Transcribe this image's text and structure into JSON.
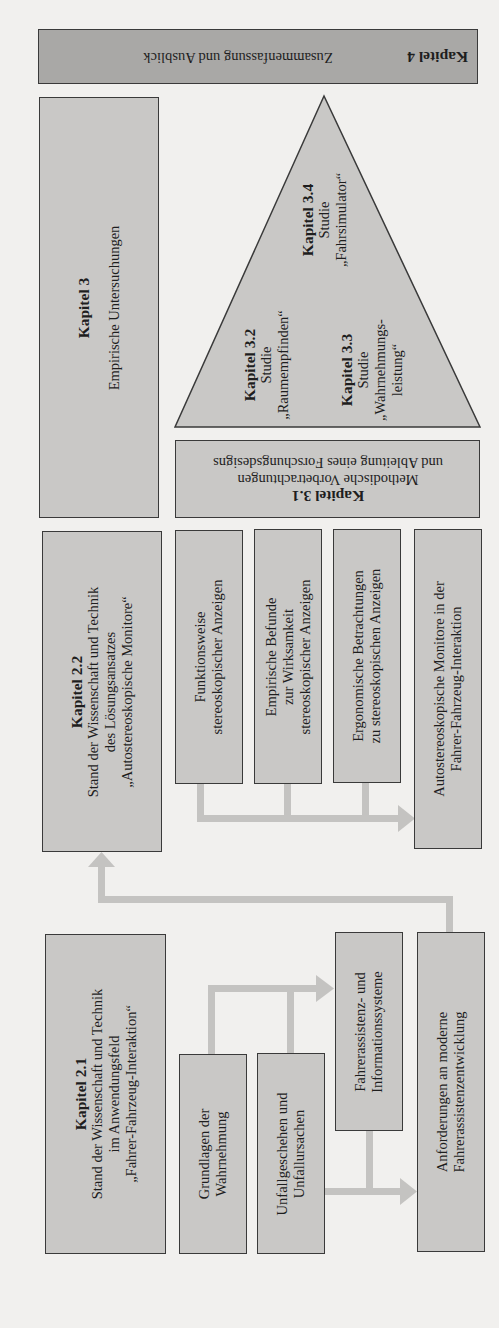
{
  "diagram": {
    "orientation": "rotated 90° counter-clockwise (landscape figure on portrait page)",
    "colors": {
      "page_background": "#f1f0ee",
      "box_fill": "#c9c8c6",
      "box_fill_dark": "#a9a8a6",
      "box_border": "#3a3a3a",
      "arrow": "#c4c3c1"
    },
    "kapitel4": {
      "title": "Kapitel 4",
      "text": "Zusammenfassung und Ausblick"
    },
    "kapitel3": {
      "title": "Kapitel 3",
      "text": "Empirische Untersuchungen"
    },
    "kapitel3_1": {
      "title": "Kapitel 3.1",
      "line1": "Methodische Vorbetrachtungen",
      "line2": "und Ableitung eines Forschungsdesigns"
    },
    "pyramid": {
      "kapitel3_2": {
        "title": "Kapitel 3.2",
        "line1": "Studie",
        "line2": "„Raumempfinden“"
      },
      "kapitel3_3": {
        "title": "Kapitel 3.3",
        "line1": "Studie",
        "line2": "„Wahrnehmungs-",
        "line3": "leistung“"
      },
      "kapitel3_4": {
        "title": "Kapitel 3.4",
        "line1": "Studie",
        "line2": "„Fahrsimulator“"
      }
    },
    "kapitel2_2": {
      "title": "Kapitel 2.2",
      "line1": "Stand der Wissenschaft und Technik",
      "line2": "des Lösungsansatzes",
      "line3": "„Autostereoskopische Monitore“"
    },
    "sub2_2": [
      {
        "line1": "Funktionsweise",
        "line2": "stereoskopischer Anzeigen"
      },
      {
        "line1": "Empirische Befunde",
        "line2": "zur Wirksamkeit",
        "line3": "stereoskopischer Anzeigen"
      },
      {
        "line1": "Ergonomische Betrachtungen",
        "line2": "zu stereoskopischen Anzeigen"
      }
    ],
    "autostereo": {
      "line1": "Autostereoskopische Monitore in der",
      "line2": "Fahrer-Fahrzeug-Interaktion"
    },
    "kapitel2_1": {
      "title": "Kapitel 2.1",
      "line1": "Stand der Wissenschaft und Technik",
      "line2": "im Anwendungsfeld",
      "line3": "„Fahrer-Fahrzeug-Interaktion“"
    },
    "sub2_1": [
      {
        "line1": "Grundlagen der",
        "line2": "Wahrnehmung"
      },
      {
        "line1": "Unfallgeschehen und",
        "line2": "Unfallursachen"
      }
    ],
    "fahrerassistenz": {
      "line1": "Fahrerassistenz- und",
      "line2": "Informationssysteme"
    },
    "anforderungen": {
      "line1": "Anforderungen an moderne",
      "line2": "Fahrerassistenzentwicklung"
    }
  }
}
